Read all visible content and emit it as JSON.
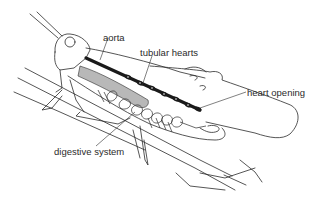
{
  "diagram": {
    "colors": {
      "background": "#ffffff",
      "line": "#2b2b2b",
      "heart": "#1a1a1a",
      "shading": "#9a9a9a"
    },
    "labels": [
      {
        "id": "aorta",
        "text": "aorta",
        "x": 103,
        "y": 33
      },
      {
        "id": "tubular-hearts",
        "text": "tubular hearts",
        "x": 140,
        "y": 51
      },
      {
        "id": "heart-opening",
        "text": "heart opening",
        "x": 247,
        "y": 93
      },
      {
        "id": "digestive-system",
        "text": "digestive system",
        "x": 54,
        "y": 148
      }
    ]
  }
}
